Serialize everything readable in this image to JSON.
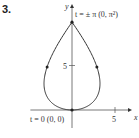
{
  "problem_number": "3.",
  "chart_data": {
    "type": "line",
    "title": "",
    "xlabel": "x",
    "ylabel": "y",
    "parametric": true,
    "parameter": "t",
    "t_range": [
      -3.14159,
      3.14159
    ],
    "x_ticks": [
      {
        "value": 5,
        "label": "5"
      }
    ],
    "y_ticks": [
      {
        "value": 5,
        "label": "5"
      }
    ],
    "xlim": [
      -6,
      6.5
    ],
    "ylim": [
      -2,
      11
    ],
    "grid": false,
    "annotations": [
      {
        "text": "t = ± π  (0, π²)",
        "x": 0,
        "y": 9.8696
      },
      {
        "text": "t = 0  (0, 0)",
        "x": 0,
        "y": 0
      }
    ],
    "points": [
      {
        "x": 0,
        "y": 9.8696,
        "label": "(0, π²)"
      },
      {
        "x": 0,
        "y": 0,
        "label": "(0, 0)"
      }
    ],
    "direction": "counterclockwise"
  }
}
